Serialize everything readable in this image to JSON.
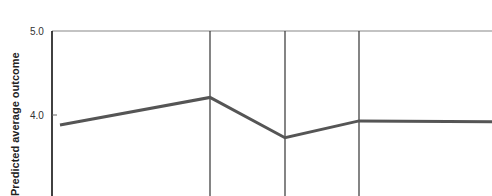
{
  "chart_data": {
    "type": "line",
    "title": "",
    "xlabel": "",
    "ylabel": "Predicted average outcome",
    "ylim": [
      3.0,
      5.0
    ],
    "yticks": [
      "5.0",
      "4.0"
    ],
    "x": [
      60,
      210,
      285,
      359,
      492
    ],
    "series": [
      {
        "name": "Predicted average outcome",
        "values": [
          3.88,
          4.21,
          3.73,
          3.93,
          3.92
        ]
      }
    ],
    "vertical_lines_x": [
      210,
      285,
      359
    ],
    "grid": false
  },
  "labels": {
    "ylabel": "Predicted average outcome",
    "tick_5": "5.0",
    "tick_4": "4.0"
  }
}
